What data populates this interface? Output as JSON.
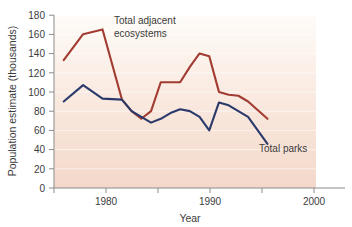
{
  "chart_data": {
    "type": "line",
    "title": "",
    "xlabel": "Year",
    "ylabel": "Population estimate (thousands)",
    "xlim": [
      1975,
      2002
    ],
    "ylim": [
      0,
      180
    ],
    "xticks": [
      1975,
      1980,
      1985,
      1990,
      1995,
      2000
    ],
    "xticklabels": [
      "",
      "1980",
      "",
      "1990",
      "",
      "2000"
    ],
    "yticks": [
      0,
      20,
      40,
      60,
      80,
      100,
      120,
      140,
      160,
      180
    ],
    "yticklabels": [
      "0",
      "20",
      "40",
      "60",
      "80",
      "100",
      "120",
      "140",
      "160",
      "180"
    ],
    "grid": "horizontal-light",
    "legend": "inline-annotations",
    "series": [
      {
        "name": "Total adjacent ecosystems",
        "color": "#a23b31",
        "x": [
          1976,
          1978,
          1980,
          1982,
          1983,
          1984,
          1985,
          1986,
          1987,
          1988,
          1989,
          1990,
          1991,
          1992,
          1993,
          1994,
          1995,
          1997
        ],
        "values": [
          133,
          160,
          165,
          92,
          80,
          72,
          80,
          110,
          110,
          110,
          126,
          140,
          137,
          100,
          97,
          96,
          90,
          72
        ]
      },
      {
        "name": "Total parks",
        "color": "#2b3a6b",
        "x": [
          1976,
          1978,
          1980,
          1982,
          1983,
          1984,
          1985,
          1986,
          1987,
          1988,
          1989,
          1990,
          1991,
          1992,
          1993,
          1995,
          1997
        ],
        "values": [
          90,
          107,
          93,
          92,
          80,
          74,
          68,
          72,
          78,
          82,
          80,
          74,
          60,
          89,
          86,
          74,
          46
        ]
      }
    ],
    "annotations": [
      {
        "name": "total-adjacent-ecosystems-label",
        "lines": [
          "Total adjacent",
          "ecosystems"
        ],
        "x": 1981.5,
        "y": 172
      },
      {
        "name": "total-parks-label",
        "lines": [
          "Total parks"
        ],
        "x": 1994.5,
        "y": 40
      }
    ],
    "background": {
      "top_color": "#fdfaf6",
      "bottom_color": "#f4dace"
    }
  }
}
